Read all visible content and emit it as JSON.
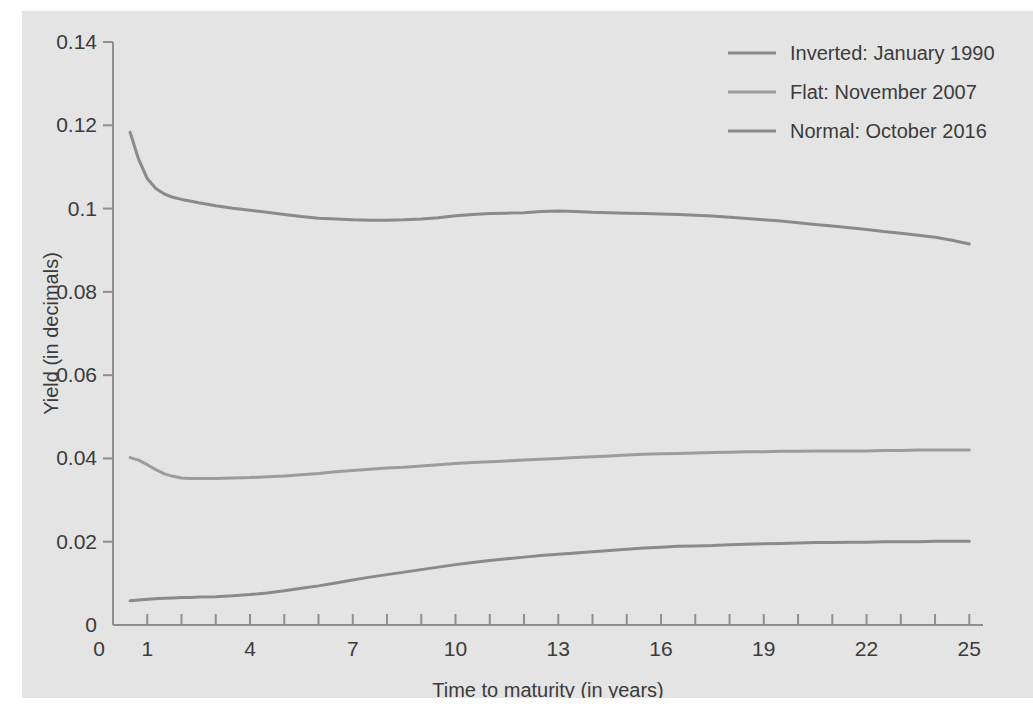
{
  "figure": {
    "background_color": "#e4e4e4",
    "page_background_color": "#ffffff",
    "axis_color": "#8f8f8f",
    "text_color": "#3b3b3b"
  },
  "chart_data": {
    "type": "line",
    "title": "",
    "xlabel": "Time to maturity (in years)",
    "ylabel": "Yield (in decimals)",
    "xlim": [
      0,
      25.4
    ],
    "ylim": [
      0,
      0.14
    ],
    "grid": false,
    "legend_position": "top-right",
    "xticks": [
      0,
      1,
      4,
      7,
      10,
      13,
      16,
      19,
      22,
      25
    ],
    "xticklabels": [
      "0",
      "1",
      "4",
      "7",
      "10",
      "13",
      "16",
      "19",
      "22",
      "25"
    ],
    "xminorticks": [
      1,
      2,
      3,
      4,
      5,
      6,
      7,
      8,
      9,
      10,
      11,
      12,
      13,
      14,
      15,
      16,
      17,
      18,
      19,
      20,
      21,
      22,
      23,
      24,
      25
    ],
    "yticks": [
      0,
      0.02,
      0.04,
      0.06,
      0.08,
      0.1,
      0.12,
      0.14
    ],
    "yticklabels": [
      "0",
      "0.02",
      "0.04",
      "0.06",
      "0.08",
      "0.1",
      "0.12",
      "0.14"
    ],
    "series": [
      {
        "name": "Inverted: January 1990",
        "color": "#8a8a8a",
        "x": [
          0.5,
          0.75,
          1,
          1.25,
          1.5,
          1.75,
          2,
          2.25,
          2.5,
          3,
          3.5,
          4,
          4.5,
          5,
          5.5,
          6,
          6.5,
          7,
          7.5,
          8,
          8.5,
          9,
          9.5,
          10,
          10.5,
          11,
          11.5,
          12,
          12.5,
          13,
          13.5,
          14,
          14.5,
          15,
          15.5,
          16,
          16.5,
          17,
          17.5,
          18,
          18.5,
          19,
          19.5,
          20,
          20.5,
          21,
          21.5,
          22,
          22.5,
          23,
          23.5,
          24,
          24.5,
          25
        ],
        "y": [
          0.1183,
          0.1118,
          0.1072,
          0.1048,
          0.1035,
          0.1027,
          0.1022,
          0.1018,
          0.1014,
          0.1007,
          0.1001,
          0.0996,
          0.0991,
          0.0986,
          0.0981,
          0.0977,
          0.0975,
          0.0973,
          0.0972,
          0.0972,
          0.0973,
          0.0975,
          0.0978,
          0.0983,
          0.0986,
          0.0988,
          0.0989,
          0.099,
          0.0993,
          0.0994,
          0.0993,
          0.0991,
          0.099,
          0.0989,
          0.0988,
          0.0987,
          0.0986,
          0.0984,
          0.0982,
          0.0979,
          0.0976,
          0.0973,
          0.097,
          0.0966,
          0.0962,
          0.0958,
          0.0954,
          0.095,
          0.0945,
          0.0941,
          0.0936,
          0.0931,
          0.0924,
          0.0915
        ]
      },
      {
        "name": "Flat: November 2007",
        "color": "#9c9c9c",
        "x": [
          0.5,
          0.75,
          1,
          1.25,
          1.5,
          1.75,
          2,
          2.25,
          2.5,
          3,
          3.5,
          4,
          4.5,
          5,
          5.5,
          6,
          6.5,
          7,
          7.5,
          8,
          8.5,
          9,
          9.5,
          10,
          10.5,
          11,
          11.5,
          12,
          12.5,
          13,
          13.5,
          14,
          14.5,
          15,
          15.5,
          16,
          16.5,
          17,
          17.5,
          18,
          18.5,
          19,
          19.5,
          20,
          20.5,
          21,
          21.5,
          22,
          22.5,
          23,
          23.5,
          24,
          24.5,
          25
        ],
        "y": [
          0.0402,
          0.0396,
          0.0385,
          0.0373,
          0.0363,
          0.0357,
          0.0353,
          0.0352,
          0.0352,
          0.0352,
          0.0353,
          0.0354,
          0.0356,
          0.0358,
          0.0361,
          0.0364,
          0.0368,
          0.0371,
          0.0374,
          0.0377,
          0.0379,
          0.0382,
          0.0385,
          0.0388,
          0.039,
          0.0392,
          0.0394,
          0.0396,
          0.0398,
          0.04,
          0.0402,
          0.0404,
          0.0406,
          0.0408,
          0.041,
          0.0411,
          0.0412,
          0.0413,
          0.0414,
          0.0415,
          0.0416,
          0.0416,
          0.0417,
          0.0417,
          0.0418,
          0.0418,
          0.0418,
          0.0418,
          0.0419,
          0.0419,
          0.042,
          0.042,
          0.042,
          0.042
        ]
      },
      {
        "name": "Normal: October 2016",
        "color": "#8a8a8a",
        "x": [
          0.5,
          0.75,
          1,
          1.25,
          1.5,
          1.75,
          2,
          2.25,
          2.5,
          3,
          3.5,
          4,
          4.5,
          5,
          5.5,
          6,
          6.5,
          7,
          7.5,
          8,
          8.5,
          9,
          9.5,
          10,
          10.5,
          11,
          11.5,
          12,
          12.5,
          13,
          13.5,
          14,
          14.5,
          15,
          15.5,
          16,
          16.5,
          17,
          17.5,
          18,
          18.5,
          19,
          19.5,
          20,
          20.5,
          21,
          21.5,
          22,
          22.5,
          23,
          23.5,
          24,
          24.5,
          25
        ],
        "y": [
          0.0058,
          0.006,
          0.0062,
          0.0063,
          0.0064,
          0.0065,
          0.0066,
          0.0066,
          0.0067,
          0.0068,
          0.007,
          0.0073,
          0.0077,
          0.0082,
          0.0088,
          0.0094,
          0.0101,
          0.0108,
          0.0115,
          0.0121,
          0.0127,
          0.0133,
          0.0139,
          0.0145,
          0.015,
          0.0155,
          0.0159,
          0.0163,
          0.0167,
          0.017,
          0.0173,
          0.0176,
          0.0179,
          0.0182,
          0.0185,
          0.0187,
          0.0189,
          0.019,
          0.0191,
          0.0193,
          0.0194,
          0.0195,
          0.0196,
          0.0197,
          0.0198,
          0.0198,
          0.0199,
          0.0199,
          0.02,
          0.02,
          0.02,
          0.0201,
          0.0201,
          0.0201
        ]
      }
    ],
    "legend": [
      {
        "label": "Inverted: January 1990",
        "color": "#8a8a8a"
      },
      {
        "label": "Flat: November 2007",
        "color": "#9c9c9c"
      },
      {
        "label": "Normal: October 2016",
        "color": "#8a8a8a"
      }
    ]
  }
}
